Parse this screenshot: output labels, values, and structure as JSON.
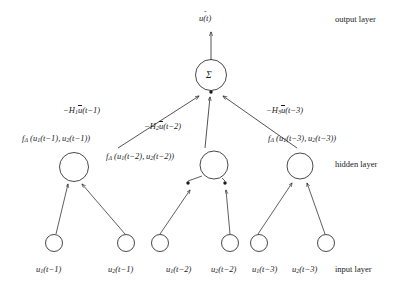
{
  "figure": {
    "type": "neural-network-diagram",
    "background_color": "#ffffff",
    "stroke_color": "#1a1a1a"
  },
  "output": {
    "node_symbol": "Σ",
    "signal_label_base": "u(t)",
    "signal_label_full": "û(t)",
    "layer_label": "output layer"
  },
  "hidden": {
    "layer_label": "hidden layer",
    "nodes": [
      {
        "function_label_prefix": "f",
        "function_label_subscript": "Δ",
        "function_label_args": "(u1(t−1), u2(t−1))",
        "arg1_base": "u",
        "arg1_sub": "1",
        "arg1_time": "(t−1)",
        "arg2_base": "u",
        "arg2_sub": "2",
        "arg2_time": "(t−1)"
      },
      {
        "function_label_prefix": "f",
        "function_label_subscript": "Δ",
        "function_label_args": "(u1(t−2), u2(t−2))",
        "arg1_base": "u",
        "arg1_sub": "1",
        "arg1_time": "(t−2)",
        "arg2_base": "u",
        "arg2_sub": "2",
        "arg2_time": "(t−2)"
      },
      {
        "function_label_prefix": "f",
        "function_label_subscript": "Δ",
        "function_label_args": "(u1(t−3), u2(t−3))",
        "arg1_base": "u",
        "arg1_sub": "1",
        "arg1_time": "(t−3)",
        "arg2_base": "u",
        "arg2_sub": "2",
        "arg2_time": "(t−3)"
      }
    ]
  },
  "weights": [
    {
      "sign": "−",
      "gain_base": "H",
      "gain_sub": "1",
      "signal_base": "u",
      "signal_time": "(t−1)"
    },
    {
      "sign": "−",
      "gain_base": "H",
      "gain_sub": "2",
      "signal_base": "u",
      "signal_time": "(t−2)"
    },
    {
      "sign": "−",
      "gain_base": "H",
      "gain_sub": "3",
      "signal_base": "u",
      "signal_time": "(t−3)"
    }
  ],
  "input": {
    "layer_label": "input layer",
    "nodes": [
      {
        "base": "u",
        "sub": "1",
        "time": "(t−1)"
      },
      {
        "base": "u",
        "sub": "2",
        "time": "(t−1)"
      },
      {
        "base": "u",
        "sub": "1",
        "time": "(t−2)"
      },
      {
        "base": "u",
        "sub": "2",
        "time": "(t−2)"
      },
      {
        "base": "u",
        "sub": "1",
        "time": "(t−3)"
      },
      {
        "base": "u",
        "sub": "2",
        "time": "(t−3)"
      }
    ]
  }
}
